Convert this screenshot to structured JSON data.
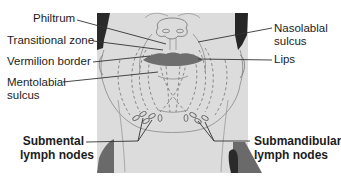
{
  "diagram": {
    "colors": {
      "panel": "#dadada",
      "hair": "#2a2a2a",
      "lips": "#6e6e6e",
      "shoulder": "#6a6a6a",
      "line": "#333333",
      "dashed": "#8a8a8a"
    },
    "labels": {
      "philtrum": "Philtrum",
      "transitional_zone": "Transitional zone",
      "vermilion_border": "Vermilion border",
      "mentolabial_1": "Mentolabial",
      "mentolabial_2": "sulcus",
      "nasolabial_1": "Nasolablal",
      "nasolabial_2": "sulcus",
      "lips": "Lips",
      "submental_1": "Submental",
      "submental_2": "lymph nodes",
      "submandibular_1": "Submandibular",
      "submandibular_2": "lymph nodes"
    }
  }
}
